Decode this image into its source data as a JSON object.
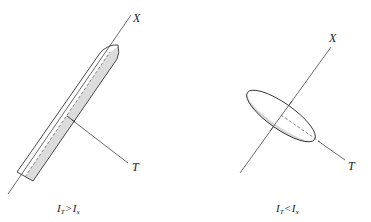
{
  "colors": {
    "stroke": "#333333",
    "shade": "#d8d8d8",
    "background": "#ffffff"
  },
  "left_figure": {
    "axis_x_label": "X",
    "axis_t_label": "T",
    "caption": {
      "lhs_symbol": "I",
      "lhs_subscript": "T",
      "operator": ">",
      "rhs_symbol": "I",
      "rhs_subscript": "x"
    },
    "shape": "elongated-rod"
  },
  "right_figure": {
    "axis_x_label": "X",
    "axis_t_label": "T",
    "caption": {
      "lhs_symbol": "I",
      "lhs_subscript": "T",
      "operator": "<",
      "rhs_symbol": "I",
      "rhs_subscript": "x"
    },
    "shape": "flat-disk"
  }
}
